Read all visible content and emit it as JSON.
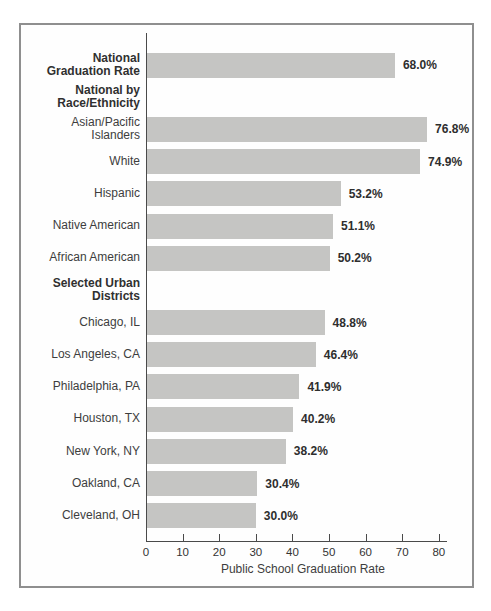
{
  "chart_data": {
    "type": "bar",
    "orientation": "horizontal",
    "title": "",
    "xlabel": "Public School Graduation Rate",
    "ylabel": "",
    "xlim": [
      0,
      80
    ],
    "xticks": [
      0,
      10,
      20,
      30,
      40,
      50,
      60,
      70,
      80
    ],
    "grid": false,
    "legend": "none",
    "bar_color": "#c5c5c3",
    "axis_color": "#4a4a4a",
    "frame_border_color": "#8f8f8f",
    "rows": [
      {
        "kind": "bar",
        "label": "National\nGraduation Rate",
        "bold_label": true,
        "value": 68.0,
        "value_label": "68.0%"
      },
      {
        "kind": "header",
        "label": "National by\nRace/Ethnicity"
      },
      {
        "kind": "bar",
        "label": "Asian/Pacific Islanders",
        "bold_label": false,
        "value": 76.8,
        "value_label": "76.8%"
      },
      {
        "kind": "bar",
        "label": "White",
        "bold_label": false,
        "value": 74.9,
        "value_label": "74.9%"
      },
      {
        "kind": "bar",
        "label": "Hispanic",
        "bold_label": false,
        "value": 53.2,
        "value_label": "53.2%"
      },
      {
        "kind": "bar",
        "label": "Native American",
        "bold_label": false,
        "value": 51.1,
        "value_label": "51.1%"
      },
      {
        "kind": "bar",
        "label": "African American",
        "bold_label": false,
        "value": 50.2,
        "value_label": "50.2%"
      },
      {
        "kind": "header",
        "label": "Selected Urban\nDistricts"
      },
      {
        "kind": "bar",
        "label": "Chicago, IL",
        "bold_label": false,
        "value": 48.8,
        "value_label": "48.8%"
      },
      {
        "kind": "bar",
        "label": "Los Angeles, CA",
        "bold_label": false,
        "value": 46.4,
        "value_label": "46.4%"
      },
      {
        "kind": "bar",
        "label": "Philadelphia, PA",
        "bold_label": false,
        "value": 41.9,
        "value_label": "41.9%"
      },
      {
        "kind": "bar",
        "label": "Houston, TX",
        "bold_label": false,
        "value": 40.2,
        "value_label": "40.2%"
      },
      {
        "kind": "bar",
        "label": "New York, NY",
        "bold_label": false,
        "value": 38.2,
        "value_label": "38.2%"
      },
      {
        "kind": "bar",
        "label": "Oakland, CA",
        "bold_label": false,
        "value": 30.4,
        "value_label": "30.4%"
      },
      {
        "kind": "bar",
        "label": "Cleveland, OH",
        "bold_label": false,
        "value": 30.0,
        "value_label": "30.0%"
      }
    ],
    "px_per_unit": 3.66
  }
}
